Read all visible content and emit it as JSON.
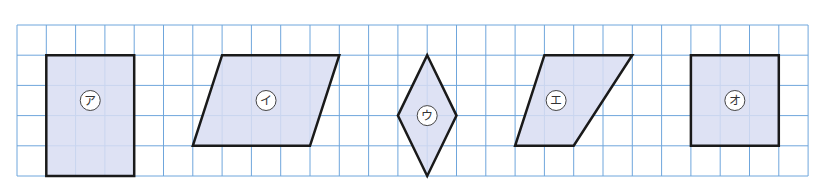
{
  "grid": {
    "origin_x": 17,
    "origin_y": 25,
    "cell_w": 29.3,
    "cell_h": 30.2,
    "cols": 27,
    "rows": 5,
    "line_color": "#6fa6dc"
  },
  "style": {
    "shape_fill": "#d8ddf2",
    "shape_stroke": "#1a1a1a"
  },
  "shapes": [
    {
      "label": "ア",
      "kind": "rectangle",
      "points": [
        [
          1,
          1
        ],
        [
          4,
          1
        ],
        [
          4,
          5
        ],
        [
          1,
          5
        ]
      ],
      "label_pos": [
        2.5,
        2.5
      ]
    },
    {
      "label": "イ",
      "kind": "parallelogram",
      "points": [
        [
          7,
          1
        ],
        [
          11,
          1
        ],
        [
          10,
          4
        ],
        [
          6,
          4
        ]
      ],
      "label_pos": [
        8.5,
        2.5
      ]
    },
    {
      "label": "ウ",
      "kind": "rhombus",
      "points": [
        [
          14,
          1
        ],
        [
          15,
          3
        ],
        [
          14,
          5
        ],
        [
          13,
          3
        ]
      ],
      "label_pos": [
        14,
        3
      ]
    },
    {
      "label": "エ",
      "kind": "parallelogram",
      "points": [
        [
          18,
          1
        ],
        [
          21,
          1
        ],
        [
          19,
          4
        ],
        [
          17,
          4
        ]
      ],
      "label_pos": [
        18.4,
        2.5
      ]
    },
    {
      "label": "オ",
      "kind": "square",
      "points": [
        [
          23,
          1
        ],
        [
          26,
          1
        ],
        [
          26,
          4
        ],
        [
          23,
          4
        ]
      ],
      "label_pos": [
        24.5,
        2.5
      ]
    }
  ]
}
